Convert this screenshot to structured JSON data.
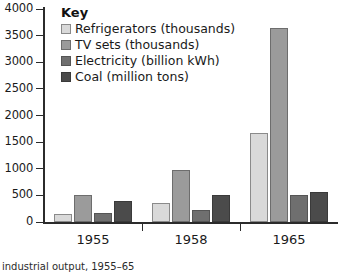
{
  "chart_data": {
    "type": "bar",
    "title": "",
    "subtitle": "",
    "xlabel": "",
    "ylabel": "",
    "categories": [
      "1955",
      "1958",
      "1965"
    ],
    "series": [
      {
        "name": "Refrigerators (thousands)",
        "values": [
          150,
          360,
          1675
        ],
        "color": "#d9d9d9"
      },
      {
        "name": "TV sets (thousands)",
        "values": [
          500,
          980,
          3650
        ],
        "color": "#9b9b9b"
      },
      {
        "name": "Electricity (billion kWh)",
        "values": [
          170,
          235,
          510
        ],
        "color": "#6f6f6f"
      },
      {
        "name": "Coal (million tons)",
        "values": [
          390,
          500,
          560
        ],
        "color": "#4b4b4b"
      }
    ],
    "ylim": [
      0,
      4000
    ],
    "yticks": [
      0,
      500,
      1000,
      1500,
      2000,
      2500,
      3000,
      3500,
      4000
    ],
    "ytick_labels": [
      "0",
      "500",
      "1000",
      "1500",
      "2000",
      "2500",
      "3000",
      "3500",
      "4000"
    ],
    "grid": false,
    "legend_position": "top-left",
    "legend_title": "Key"
  },
  "legend": {
    "title": "Key",
    "entries": [
      "Refrigerators (thousands)",
      "TV sets (thousands)",
      "Electricity (billion kWh)",
      "Coal (million tons)"
    ]
  },
  "caption": {
    "text": "industrial output, 1955–65"
  }
}
